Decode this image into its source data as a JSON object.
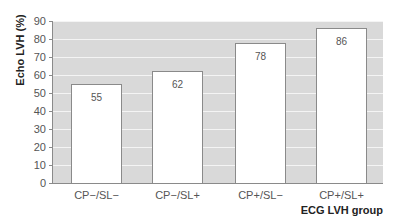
{
  "chart_data": {
    "type": "bar",
    "title": "",
    "xlabel": "ECG LVH group",
    "ylabel": "Echo LVH (%)",
    "categories": [
      "CP−/SL−",
      "CP−/SL+",
      "CP+/SL−",
      "CP+/SL+"
    ],
    "values": [
      55,
      62,
      78,
      86
    ],
    "data_labels": [
      "55",
      "62",
      "78",
      "86"
    ],
    "ylim": [
      0,
      90
    ],
    "yticks": [
      0,
      10,
      20,
      30,
      40,
      50,
      60,
      70,
      80,
      90
    ],
    "grid": true,
    "legend": null,
    "colors": {
      "plot_background": "#d9d9d9",
      "bar_fill": "#ffffff",
      "bar_edge": "#8a8a8a",
      "gridline": "#f4f4f4"
    }
  },
  "axis": {
    "ytick_labels": [
      "0",
      "10",
      "20",
      "30",
      "40",
      "50",
      "60",
      "70",
      "80",
      "90"
    ]
  }
}
